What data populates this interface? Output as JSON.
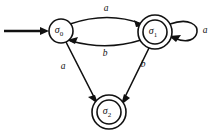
{
  "figure": {
    "kind": "finite-state-automaton",
    "background_color": "#ffffff",
    "stroke_color": "#111111",
    "width": 216,
    "height": 130
  },
  "states": [
    {
      "id": "sigma0",
      "symbol": "σ",
      "subscript": "0",
      "label": "σ₀",
      "type": "start",
      "accepting": false,
      "cx": 61,
      "cy": 31,
      "r_outer": 12,
      "r_inner": 0
    },
    {
      "id": "sigma1",
      "symbol": "σ",
      "subscript": "1",
      "label": "σ₁",
      "type": "accepting",
      "accepting": true,
      "cx": 155,
      "cy": 32,
      "r_outer": 17,
      "r_inner": 12
    },
    {
      "id": "sigma2",
      "symbol": "σ",
      "subscript": "2",
      "label": "σ₂",
      "type": "accepting",
      "accepting": true,
      "cx": 109,
      "cy": 112,
      "r_outer": 17,
      "r_inner": 12
    }
  ],
  "transitions": [
    {
      "id": "t0",
      "from": "sigma0",
      "to": "sigma1",
      "label": "a",
      "shape": "arc-top",
      "label_x": 106,
      "label_y": 9
    },
    {
      "id": "t1",
      "from": "sigma1",
      "to": "sigma0",
      "label": "b",
      "shape": "arc-bottom",
      "label_x": 105,
      "label_y": 54
    },
    {
      "id": "t2",
      "from": "sigma0",
      "to": "sigma2",
      "label": "a",
      "shape": "line",
      "label_x": 63,
      "label_y": 67
    },
    {
      "id": "t3",
      "from": "sigma1",
      "to": "sigma2",
      "label": "b",
      "shape": "line",
      "label_x": 143,
      "label_y": 65
    },
    {
      "id": "t4",
      "from": "sigma1",
      "to": "sigma1",
      "label": "a",
      "shape": "self-loop",
      "label_x": 205,
      "label_y": 31
    }
  ],
  "start_marker": {
    "name": "start-arrow",
    "from_x": 4,
    "to_x": 48,
    "y": 31
  },
  "alphabet": [
    "a",
    "b"
  ]
}
